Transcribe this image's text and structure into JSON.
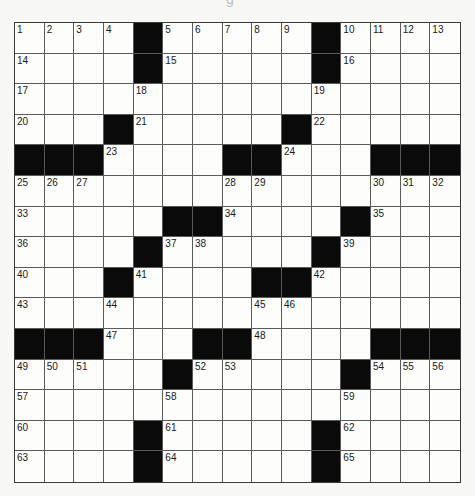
{
  "puzzle": {
    "top_fragment": "g",
    "rows": 15,
    "cols": 15,
    "colors": {
      "black": "#0a0a0a",
      "white": "#fdfdfb",
      "line": "#5a5a5a"
    },
    "black_cells": [
      [
        0,
        4
      ],
      [
        0,
        10
      ],
      [
        1,
        4
      ],
      [
        1,
        10
      ],
      [
        3,
        3
      ],
      [
        3,
        9
      ],
      [
        4,
        0
      ],
      [
        4,
        1
      ],
      [
        4,
        2
      ],
      [
        4,
        7
      ],
      [
        4,
        8
      ],
      [
        4,
        12
      ],
      [
        4,
        13
      ],
      [
        4,
        14
      ],
      [
        6,
        5
      ],
      [
        6,
        6
      ],
      [
        6,
        11
      ],
      [
        7,
        4
      ],
      [
        7,
        10
      ],
      [
        8,
        3
      ],
      [
        8,
        8
      ],
      [
        8,
        9
      ],
      [
        10,
        0
      ],
      [
        10,
        1
      ],
      [
        10,
        2
      ],
      [
        10,
        6
      ],
      [
        10,
        7
      ],
      [
        10,
        12
      ],
      [
        10,
        13
      ],
      [
        10,
        14
      ],
      [
        11,
        5
      ],
      [
        11,
        11
      ],
      [
        13,
        4
      ],
      [
        13,
        10
      ],
      [
        14,
        4
      ],
      [
        14,
        10
      ]
    ],
    "numbers": {
      "0,0": "1",
      "0,1": "2",
      "0,2": "3",
      "0,3": "4",
      "0,5": "5",
      "0,6": "6",
      "0,7": "7",
      "0,8": "8",
      "0,9": "9",
      "0,11": "10",
      "0,12": "11",
      "0,13": "12",
      "0,14": "13",
      "1,0": "14",
      "1,5": "15",
      "1,11": "16",
      "2,0": "17",
      "2,4": "18",
      "2,10": "19",
      "3,0": "20",
      "3,4": "21",
      "3,10": "22",
      "4,3": "23",
      "4,9": "24",
      "5,0": "25",
      "5,1": "26",
      "5,2": "27",
      "5,7": "28",
      "5,8": "29",
      "5,12": "30",
      "5,13": "31",
      "5,14": "32",
      "6,0": "33",
      "6,7": "34",
      "6,12": "35",
      "7,0": "36",
      "7,5": "37",
      "7,6": "38",
      "7,11": "39",
      "8,0": "40",
      "8,4": "41",
      "8,10": "42",
      "9,0": "43",
      "9,3": "44",
      "9,8": "45",
      "9,9": "46",
      "10,3": "47",
      "10,8": "48",
      "11,0": "49",
      "11,1": "50",
      "11,2": "51",
      "11,6": "52",
      "11,7": "53",
      "11,12": "54",
      "11,13": "55",
      "11,14": "56",
      "12,0": "57",
      "12,5": "58",
      "12,11": "59",
      "13,0": "60",
      "13,5": "61",
      "13,11": "62",
      "14,0": "63",
      "14,5": "64",
      "14,11": "65"
    }
  }
}
